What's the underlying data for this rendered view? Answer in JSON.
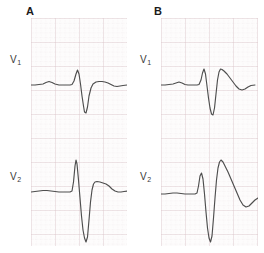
{
  "figure": {
    "type": "ecg-figure",
    "background_color": "#ffffff",
    "grid": {
      "paper_color": "#fdfcfc",
      "minor_line_color": "#e6d7da",
      "major_line_color": "#d8c2c7",
      "minor_spacing_px": 4.8,
      "major_every": 5
    },
    "trace_color": "#4a4a4a",
    "trace_width": 1.1
  },
  "panels": [
    {
      "id": "panel-a",
      "label": "A",
      "leads": [
        {
          "id": "a-v1",
          "label": "V",
          "subscript": "1"
        },
        {
          "id": "a-v2",
          "label": "V",
          "subscript": "2"
        }
      ]
    },
    {
      "id": "panel-b",
      "label": "B",
      "leads": [
        {
          "id": "b-v1",
          "label": "V",
          "subscript": "1"
        },
        {
          "id": "b-v2",
          "label": "V",
          "subscript": "2"
        }
      ]
    }
  ],
  "chart_data": {
    "type": "line",
    "title": "",
    "xlabel": "",
    "ylabel": "",
    "grid": true,
    "legend_position": "none",
    "series": [
      {
        "name": "A-V1",
        "panel": "A",
        "lead": "V1",
        "morphology": "small P wave, small r with deep S wave (rS), low flat T wave, saddle-shaped ST",
        "baseline_y": 67,
        "points": "0,67 4,67 8,66.5 12,66 15,64.5 18,63.5 21,64.5 24,66 28,67 32,67 36,67 39,67 41,66.5 43,63 45,56 46.5,52 48,56 49.5,66 51,78 52.5,88 53.5,94 55,95 56.5,89 58,78 60,70 62,66 65,64 68,63.5 71,63.5 74,64 77,65 80,66.5 83,68 86,68.5 89,68 92,67.5 96,67"
      },
      {
        "name": "A-V2",
        "panel": "A",
        "lead": "V2",
        "morphology": "low P wave, very tall narrow R followed by very deep S (RS), small positive T",
        "baseline_y": 60,
        "points": "0,60 4,59.5 8,59 12,58.5 16,58.5 20,59 24,59.5 28,60 32,60 36,60 39,60 41,59 42.5,50 44,34 45,28 46,32 47.5,48 49,66 50.5,84 52,98 53.5,106 55,110 56.5,105 58,88 59.5,70 61,58 62.5,52 64,50 66,49.5 69,50 72,51 75,52 78,54 81,57 84,59 87,60 90,60 93,59.5 97,59"
      },
      {
        "name": "B-V1",
        "panel": "B",
        "lead": "V1",
        "morphology": "small P, small r with deep S, coved downsloping ST segment with negative T wave (Brugada type 1 pattern)",
        "baseline_y": 67,
        "points": "0,67 4,67 8,66.5 12,66 15,65 18,64 21,65 24,66.5 27,67 30,67 33,67 36,67 38,66.5 40,62 41.5,55 43,51 44.5,56 46,68 47.5,80 49,90 50.5,96 52,97 53.5,90 55,76 56.5,62 58,54 59.5,51 61,51.5 63,53 66,56 69,60 72,64 75,68 78,71 81,72 84,71 87,69 90,67.5 94,67"
      },
      {
        "name": "B-V2",
        "panel": "B",
        "lead": "V2",
        "morphology": "small r, deep S, marked coved ST elevation descending into an inverted T wave (Brugada type 1)",
        "baseline_y": 62,
        "points": "0,62 4,62 8,61.5 12,61 16,61 20,61.5 24,62 28,62 31,62 34,62 36,61 37.5,54 39,44 40.5,41 42,47 43.5,62 45,80 46.5,96 48,106 49.5,110 51,104 52.5,86 54,66 55.5,48 57,36 58.5,30 60,28 62,30 64,34 67,40 70,47 73,54 76,61 79,68 82,73 85,75 88,74 91,71 94,68 97,66 100,65.5"
      }
    ],
    "axes": {
      "panel_width_px": 96,
      "panel_height_px": 228,
      "viewbox_x": [
        0,
        96
      ],
      "viewbox_y": [
        0,
        114
      ]
    }
  }
}
